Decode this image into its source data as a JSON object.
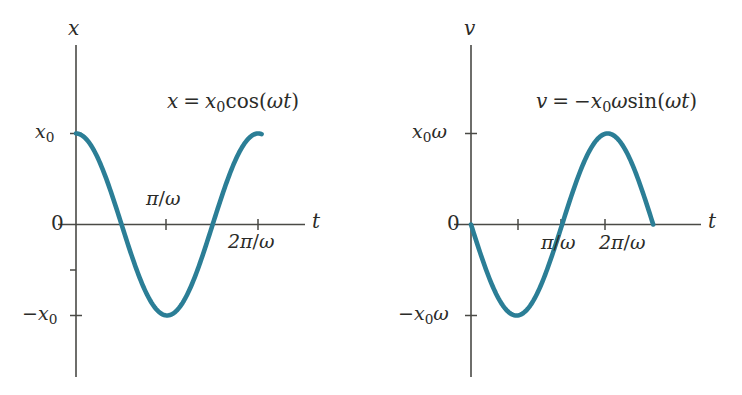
{
  "figure": {
    "background_color": "#ffffff",
    "curve_color": "#2b7e96",
    "axis_color": "#4a4a46",
    "text_color": "#2b2b28"
  },
  "panels": [
    {
      "id": "displacement",
      "equation": {
        "lhs": "x",
        "eq": "=",
        "amp": "x",
        "amp_sub": "0",
        "func": "cos",
        "arg_open": "(",
        "arg_omega": "ω",
        "arg_t": "t",
        "arg_close": ")",
        "plain": "x = x₀cos(ωt)"
      },
      "y_axis_label": "x",
      "x_axis_label": "t",
      "y_ticks": [
        {
          "label_main": "x",
          "label_sub": "0",
          "plain": "x₀",
          "value": 1
        },
        {
          "label_main": "0",
          "label_sub": "",
          "plain": "0",
          "value": 0
        },
        {
          "label_main": "−x",
          "label_sub": "0",
          "plain": "−x₀",
          "value": -1
        }
      ],
      "x_ticks": [
        {
          "num": "π",
          "den": "ω",
          "plain": "π/ω",
          "value": 3.14159
        },
        {
          "num": "2π",
          "den": "ω",
          "plain": "2π/ω",
          "value": 6.28319
        }
      ]
    },
    {
      "id": "velocity",
      "equation": {
        "lhs": "v",
        "eq": "=",
        "sign": "−",
        "amp": "x",
        "amp_sub": "0",
        "amp_omega": "ω",
        "func": "sin",
        "arg_open": "(",
        "arg_omega": "ω",
        "arg_t": "t",
        "arg_close": ")",
        "plain": "v = −x₀ωsin(ωt)"
      },
      "y_axis_label": "v",
      "x_axis_label": "t",
      "y_ticks": [
        {
          "label_main": "x",
          "label_sub": "0",
          "label_tail": "ω",
          "plain": "x₀ω",
          "value": 1
        },
        {
          "label_main": "0",
          "label_sub": "",
          "label_tail": "",
          "plain": "0",
          "value": 0
        },
        {
          "label_main": "−x",
          "label_sub": "0",
          "label_tail": "ω",
          "plain": "−x₀ω",
          "value": -1
        }
      ],
      "x_ticks": [
        {
          "num": "π",
          "den": "ω",
          "plain": "π/ω",
          "value": 3.14159
        },
        {
          "num": "2π",
          "den": "ω",
          "plain": "2π/ω",
          "value": 6.28319
        }
      ]
    }
  ],
  "chart_data": [
    {
      "type": "line",
      "id": "displacement-vs-time",
      "title": "x = x₀cos(ωt)",
      "xlabel": "t",
      "ylabel": "x",
      "xlim": [
        0,
        6.8068
      ],
      "ylim": [
        -1.45,
        1.6
      ],
      "grid": false,
      "legend": "none",
      "xtick_values": [
        3.14159,
        6.28319
      ],
      "xtick_labels": [
        "π/ω",
        "2π/ω"
      ],
      "ytick_values": [
        1,
        0,
        -1
      ],
      "ytick_labels": [
        "x₀",
        "0",
        "−x₀"
      ],
      "series": [
        {
          "name": "x = x₀cos(ωt)",
          "color": "#2b7e96",
          "formula": "cos",
          "amplitude": 1,
          "phase": 0,
          "x_start": 0,
          "x_end": 6.4,
          "x": [
            0.0,
            0.3351,
            0.6702,
            1.0053,
            1.3404,
            1.6755,
            2.0106,
            2.3457,
            2.6808,
            3.0159,
            3.351,
            3.6861,
            4.0212,
            4.3563,
            4.6914,
            5.0265,
            5.3616,
            5.6967,
            6.0318,
            6.4
          ],
          "y": [
            1.0,
            0.9444,
            0.7836,
            0.5358,
            0.2284,
            -0.1045,
            -0.4258,
            -0.7008,
            -0.9009,
            -1.0,
            -0.9755,
            -0.8502,
            -0.6282,
            -0.3546,
            -0.0262,
            0.309,
            0.5942,
            0.823,
            0.9702,
            0.9933
          ]
        }
      ]
    },
    {
      "type": "line",
      "id": "velocity-vs-time",
      "title": "v = −x₀ωsin(ωt)",
      "xlabel": "t",
      "ylabel": "v",
      "xlim": [
        0,
        6.8068
      ],
      "ylim": [
        -1.45,
        1.6
      ],
      "grid": false,
      "legend": "none",
      "xtick_values": [
        3.14159,
        6.28319
      ],
      "xtick_labels": [
        "π/ω",
        "2π/ω"
      ],
      "ytick_values": [
        1,
        0,
        -1
      ],
      "ytick_labels": [
        "x₀ω",
        "0",
        "−x₀ω"
      ],
      "series": [
        {
          "name": "v = −x₀ωsin(ωt)",
          "color": "#2b7e96",
          "formula": "-sin",
          "amplitude": 1,
          "phase": 0,
          "x_start": 0,
          "x_end": 6.28319,
          "x": [
            0.0,
            0.3307,
            0.6614,
            0.9922,
            1.3229,
            1.6536,
            1.9844,
            2.3151,
            2.6458,
            2.9766,
            3.3073,
            3.638,
            3.9687,
            4.2995,
            4.6302,
            4.9609,
            5.2917,
            5.6224,
            5.9531,
            6.2832
          ],
          "y": [
            0.0,
            -0.3247,
            -0.6142,
            -0.838,
            -0.9694,
            -0.9966,
            -0.9163,
            -0.7374,
            -0.4792,
            -0.1685,
            0.1646,
            0.4759,
            0.7347,
            0.9148,
            0.9961,
            0.9686,
            0.8368,
            0.6126,
            0.3228,
            0.0
          ]
        }
      ]
    }
  ]
}
